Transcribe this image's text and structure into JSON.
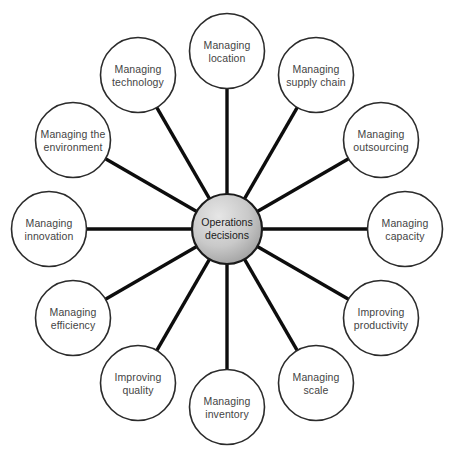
{
  "diagram": {
    "type": "hub-and-spoke",
    "center": {
      "label": "Operations\ndecisions",
      "line1": "Operations",
      "line2": "decisions",
      "radius": 35,
      "cx": 227,
      "cy": 229,
      "fill_light": "#e0e0e0",
      "fill_dark": "#9a9a9a",
      "stroke": "#1a1a1a",
      "stroke_width": 2.2,
      "text_color": "#1a1a1a"
    },
    "style": {
      "node_radius": 37.5,
      "ring_radius": 178,
      "node_stroke": "#2b2b2b",
      "node_stroke_width": 1.6,
      "node_fill": "#ffffff",
      "node_text_color": "#444444",
      "spoke_color": "#0d0d0d",
      "spoke_width": 3.4,
      "background": "#ffffff"
    },
    "nodes": [
      {
        "id": "managing-location",
        "label": "Managing\nlocation",
        "angle_deg": -90,
        "cx": 227,
        "cy": 51
      },
      {
        "id": "managing-supply-chain",
        "label": "Managing\nsupply chain",
        "angle_deg": -60,
        "cx": 316,
        "cy": 75
      },
      {
        "id": "managing-outsourcing",
        "label": "Managing\noutsourcing",
        "angle_deg": -30,
        "cx": 381,
        "cy": 140
      },
      {
        "id": "managing-capacity",
        "label": "Managing\ncapacity",
        "angle_deg": 0,
        "cx": 405,
        "cy": 229
      },
      {
        "id": "improving-productivity",
        "label": "Improving\nproductivity",
        "angle_deg": 30,
        "cx": 381,
        "cy": 318
      },
      {
        "id": "managing-scale",
        "label": "Managing\nscale",
        "angle_deg": 60,
        "cx": 316,
        "cy": 383
      },
      {
        "id": "managing-inventory",
        "label": "Managing\ninventory",
        "angle_deg": 90,
        "cx": 227,
        "cy": 407
      },
      {
        "id": "improving-quality",
        "label": "Improving\nquality",
        "angle_deg": 120,
        "cx": 138,
        "cy": 383
      },
      {
        "id": "managing-efficiency",
        "label": "Managing\nefficiency",
        "angle_deg": 150,
        "cx": 73,
        "cy": 318
      },
      {
        "id": "managing-innovation",
        "label": "Managing\ninnovation",
        "angle_deg": 180,
        "cx": 49,
        "cy": 229
      },
      {
        "id": "managing-the-environment",
        "label": "Managing the\nenvironment",
        "angle_deg": 210,
        "cx": 73,
        "cy": 140
      },
      {
        "id": "managing-technology",
        "label": "Managing\ntechnology",
        "angle_deg": 240,
        "cx": 138,
        "cy": 75
      }
    ]
  }
}
